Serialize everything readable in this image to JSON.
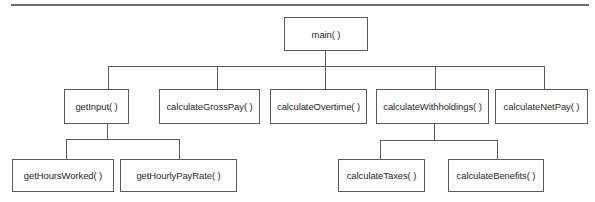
{
  "diagram": {
    "type": "hierarchy-chart",
    "root": {
      "label": "main( )",
      "children": [
        {
          "label": "getInput( )",
          "children": [
            {
              "label": "getHoursWorked( )"
            },
            {
              "label": "getHourlyPayRate( )"
            }
          ]
        },
        {
          "label": "calculateGrossPay( )"
        },
        {
          "label": "calculateOvertime( )"
        },
        {
          "label": "calculateWithholdings( )",
          "children": [
            {
              "label": "calculateTaxes( )"
            },
            {
              "label": "calculateBenefits( )"
            }
          ]
        },
        {
          "label": "calculateNetPay( )"
        }
      ]
    },
    "colors": {
      "line": "#5a5a5a",
      "text": "#2a2a2a",
      "rule": "#6b6b6b",
      "background": "#ffffff"
    }
  }
}
